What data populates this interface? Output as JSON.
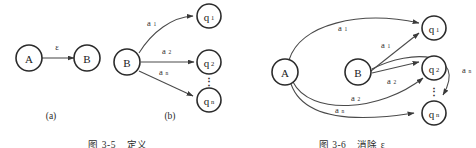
{
  "figure": {
    "panels": [
      {
        "id": "panel-a",
        "label": "(a)",
        "nodes": [
          {
            "id": "a-A",
            "text": "A",
            "sub": ""
          },
          {
            "id": "a-B",
            "text": "B",
            "sub": ""
          }
        ],
        "edges": [
          {
            "id": "a-edge-eps",
            "label": "ε",
            "sub": "",
            "from": "A",
            "to": "B"
          }
        ]
      },
      {
        "id": "panel-b",
        "label": "(b)",
        "nodes": [
          {
            "id": "b-B",
            "text": "B",
            "sub": ""
          },
          {
            "id": "b-q1",
            "text": "q",
            "sub": "1"
          },
          {
            "id": "b-q2",
            "text": "q",
            "sub": "2"
          },
          {
            "id": "b-qn",
            "text": "q",
            "sub": "n"
          }
        ],
        "edges": [
          {
            "id": "b-edge-a1",
            "label": "a",
            "sub": "1",
            "from": "B",
            "to": "q1"
          },
          {
            "id": "b-edge-a2",
            "label": "a",
            "sub": "2",
            "from": "B",
            "to": "q2"
          },
          {
            "id": "b-edge-an",
            "label": "a",
            "sub": "n",
            "from": "B",
            "to": "qn"
          }
        ],
        "ellipsis": "⋮"
      },
      {
        "id": "panel-c",
        "label": "",
        "nodes": [
          {
            "id": "c-A",
            "text": "A",
            "sub": ""
          },
          {
            "id": "c-B",
            "text": "B",
            "sub": ""
          },
          {
            "id": "c-q1",
            "text": "q",
            "sub": "1"
          },
          {
            "id": "c-q2",
            "text": "q",
            "sub": "2"
          },
          {
            "id": "c-qn",
            "text": "q",
            "sub": "n"
          }
        ],
        "edges": [
          {
            "id": "c-edge-A-q1",
            "label": "a",
            "sub": "1",
            "from": "A",
            "to": "q1"
          },
          {
            "id": "c-edge-A-q2",
            "label": "a",
            "sub": "2",
            "from": "A",
            "to": "q2"
          },
          {
            "id": "c-edge-A-qn",
            "label": "a",
            "sub": "n",
            "from": "A",
            "to": "qn"
          },
          {
            "id": "c-edge-B-q1",
            "label": "a",
            "sub": "1",
            "from": "B",
            "to": "q1"
          },
          {
            "id": "c-edge-B-q2",
            "label": "a",
            "sub": "2",
            "from": "B",
            "to": "q2"
          },
          {
            "id": "c-edge-B-qn",
            "label": "a",
            "sub": "n",
            "from": "B",
            "to": "qn"
          }
        ],
        "ellipsis": "⋮"
      }
    ],
    "captions": [
      {
        "id": "caption-left",
        "text": "图 3-5　定义"
      },
      {
        "id": "caption-right",
        "text": "图 3-6　消除 ε"
      }
    ]
  },
  "colors": {
    "node_stroke": "#2b2b2b",
    "edge_stroke": "#4a4a4a",
    "text": "#1a1a1a",
    "background": "#ffffff"
  }
}
